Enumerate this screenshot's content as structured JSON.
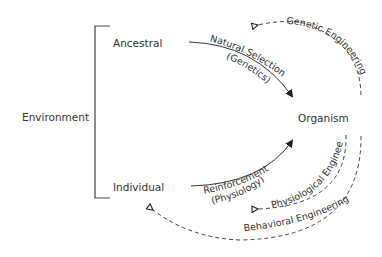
{
  "labels": {
    "environment": "Environment",
    "ancestral": "Ancestral",
    "individual": "Individual",
    "organism": "Organism"
  },
  "arrows": {
    "natural_selection": {
      "label": "Natural Selection",
      "sublabel": "(Genetics)",
      "style": "solid"
    },
    "reinforcement": {
      "label": "Reinforcement",
      "sublabel": "(Physiology)",
      "style": "solid"
    },
    "genetic_engineering": {
      "label": "Genetic Engineering",
      "style": "dashed"
    },
    "physiological_engineering": {
      "label": "Physiological Engineering",
      "style": "dashed"
    },
    "behavioral_engineering": {
      "label": "Behavioral Engineering",
      "style": "dashed"
    }
  },
  "colors": {
    "line": "#333333",
    "text": "#333333",
    "background": "#ffffff"
  }
}
